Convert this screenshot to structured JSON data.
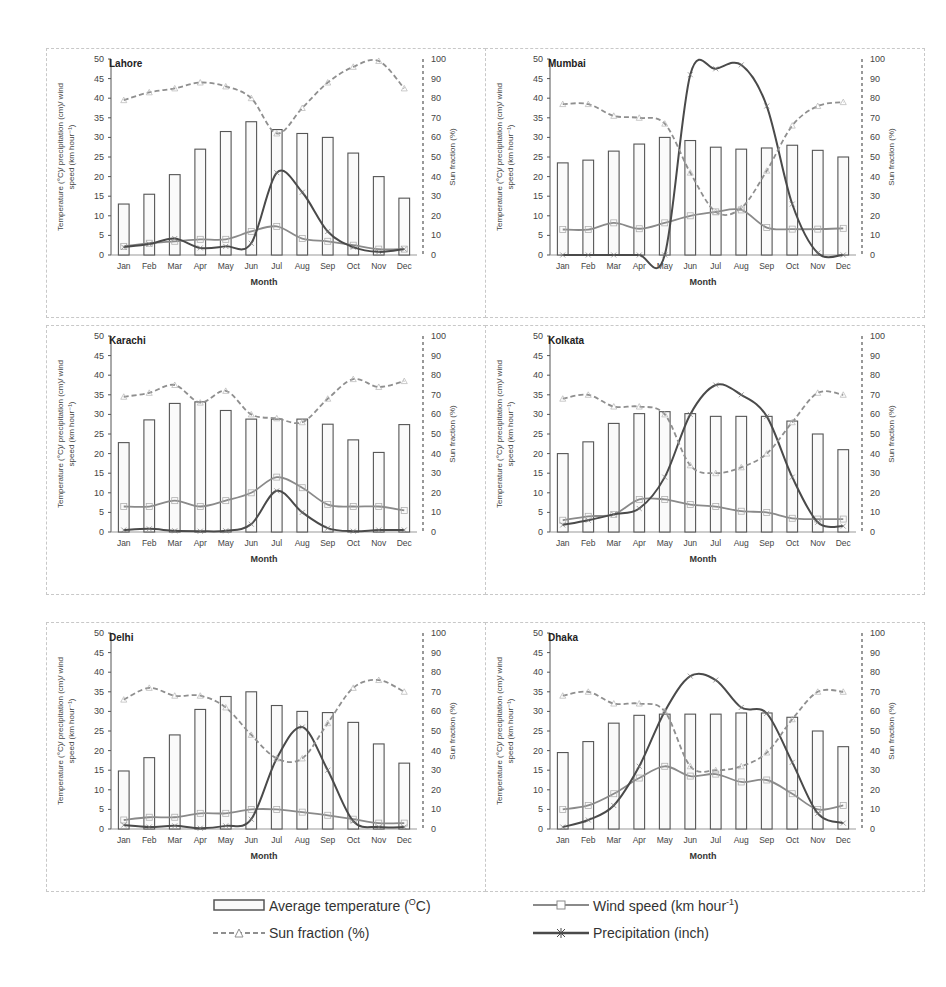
{
  "chart_data": [
    {
      "type": "bar+line",
      "title": "Lahore",
      "categories": [
        "Jan",
        "Feb",
        "Mar",
        "Apr",
        "May",
        "Jun",
        "Jul",
        "Aug",
        "Sep",
        "Oct",
        "Nov",
        "Dec"
      ],
      "xlabel": "Month",
      "ylabel": "Temperature (°C)/ precipitation (cm)/ wind speed (km hour⁻¹)",
      "y2label": "Sun fraction (%)",
      "ylim": [
        0,
        50
      ],
      "y2lim": [
        0,
        100
      ],
      "series": [
        {
          "name": "Average temperature (°C)",
          "type": "bar",
          "axis": "left",
          "values": [
            13,
            15.5,
            20.5,
            27,
            31.5,
            34,
            32,
            31,
            30,
            26,
            20,
            14.5
          ]
        },
        {
          "name": "Wind speed (km hour-1)",
          "type": "line",
          "axis": "left",
          "values": [
            2.2,
            3,
            3.5,
            4,
            4,
            6,
            7.3,
            4.2,
            3.5,
            2.5,
            1.5,
            1.5
          ]
        },
        {
          "name": "Precipitation (inch)",
          "type": "line",
          "axis": "left",
          "values": [
            2,
            2.8,
            4.2,
            1.8,
            2.2,
            3,
            21,
            16,
            6,
            2,
            0.8,
            1.5
          ]
        },
        {
          "name": "Sun fraction (%)",
          "type": "line",
          "axis": "right",
          "values": [
            79,
            83,
            85,
            88,
            86,
            80,
            62,
            75,
            88,
            96,
            99,
            85
          ]
        }
      ]
    },
    {
      "type": "bar+line",
      "title": "Mumbai",
      "categories": [
        "Jan",
        "Feb",
        "Mar",
        "Apr",
        "May",
        "Jun",
        "Jul",
        "Aug",
        "Sep",
        "Oct",
        "Nov",
        "Dec"
      ],
      "xlabel": "Month",
      "ylabel": "Temperature (°C)/ precipitation (cm)/ wind speed (km hour⁻¹)",
      "y2label": "Sun fraction (%)",
      "ylim": [
        0,
        50
      ],
      "y2lim": [
        0,
        100
      ],
      "series": [
        {
          "name": "Average temperature (°C)",
          "type": "bar",
          "axis": "left",
          "values": [
            23.5,
            24.2,
            26.5,
            28.3,
            30,
            29.2,
            27.5,
            27,
            27.3,
            28,
            26.7,
            25
          ]
        },
        {
          "name": "Wind speed (km hour-1)",
          "type": "line",
          "axis": "left",
          "values": [
            6.5,
            6.5,
            8.2,
            6.7,
            8.2,
            10,
            11,
            11.5,
            7,
            6.6,
            6.6,
            6.8
          ]
        },
        {
          "name": "Precipitation (inch)",
          "type": "line",
          "axis": "left",
          "values": [
            0,
            0,
            0,
            0,
            0,
            46,
            47.5,
            48.5,
            38,
            13,
            0.5,
            0
          ]
        },
        {
          "name": "Sun fraction (%)",
          "type": "line",
          "axis": "right",
          "values": [
            77,
            77,
            71,
            70,
            67,
            42,
            22,
            24,
            43,
            66,
            76,
            78
          ]
        }
      ]
    },
    {
      "type": "bar+line",
      "title": "Karachi",
      "categories": [
        "Jan",
        "Feb",
        "Mar",
        "Apr",
        "May",
        "Jun",
        "Jul",
        "Aug",
        "Sep",
        "Oct",
        "Nov",
        "Dec"
      ],
      "xlabel": "Month",
      "ylabel": "Temperature (°C)/ precipitation (cm)/ wind speed (km hour⁻¹)",
      "y2label": "Sun fraction (%)",
      "ylim": [
        0,
        50
      ],
      "y2lim": [
        0,
        100
      ],
      "series": [
        {
          "name": "Average temperature (°C)",
          "type": "bar",
          "axis": "left",
          "values": [
            22.8,
            28.6,
            32.8,
            33.2,
            31,
            28.8,
            28.8,
            28.8,
            27.5,
            23.5,
            20.3,
            27.4
          ]
        },
        {
          "name": "Wind speed (km hour-1)",
          "type": "line",
          "axis": "left",
          "values": [
            6.5,
            6.5,
            8,
            6.5,
            8,
            10,
            14,
            11.3,
            7,
            6.5,
            6.5,
            5.5
          ]
        },
        {
          "name": "Precipitation (inch)",
          "type": "line",
          "axis": "left",
          "values": [
            0.5,
            0.8,
            0.3,
            0.2,
            0.3,
            2,
            10.5,
            5,
            1,
            0.2,
            0.5,
            0.5
          ]
        },
        {
          "name": "Sun fraction (%)",
          "type": "line",
          "axis": "right",
          "values": [
            69,
            71,
            75,
            66,
            72,
            60,
            58,
            56,
            68,
            78,
            74,
            77
          ]
        }
      ]
    },
    {
      "type": "bar+line",
      "title": "Kolkata",
      "categories": [
        "Jan",
        "Feb",
        "Mar",
        "Apr",
        "May",
        "Jun",
        "Jul",
        "Aug",
        "Sep",
        "Oct",
        "Nov",
        "Dec"
      ],
      "xlabel": "Month",
      "ylabel": "Temperature (°C)/ precipitation (cm)/ wind speed (km hour⁻¹)",
      "y2label": "Sun fraction (%)",
      "ylim": [
        0,
        50
      ],
      "y2lim": [
        0,
        100
      ],
      "series": [
        {
          "name": "Average temperature (°C)",
          "type": "bar",
          "axis": "left",
          "values": [
            20,
            23,
            27.7,
            30.2,
            30.7,
            30.2,
            29.5,
            29.5,
            29.5,
            28.3,
            25,
            21
          ]
        },
        {
          "name": "Wind speed (km hour-1)",
          "type": "line",
          "axis": "left",
          "values": [
            3,
            4,
            4.5,
            8.3,
            8.3,
            7,
            6.5,
            5.3,
            5,
            3.5,
            3.3,
            3.3
          ]
        },
        {
          "name": "Precipitation (inch)",
          "type": "line",
          "axis": "left",
          "values": [
            1.8,
            3,
            4.5,
            6,
            14,
            30,
            37.5,
            35,
            29.5,
            14,
            2.5,
            1.5
          ]
        },
        {
          "name": "Sun fraction (%)",
          "type": "line",
          "axis": "right",
          "values": [
            68,
            70,
            64,
            64,
            60,
            34,
            30,
            33,
            40,
            56,
            71,
            70
          ]
        }
      ]
    },
    {
      "type": "bar+line",
      "title": "Delhi",
      "categories": [
        "Jan",
        "Feb",
        "Mar",
        "Apr",
        "May",
        "Jun",
        "Jul",
        "Aug",
        "Sep",
        "Oct",
        "Nov",
        "Dec"
      ],
      "xlabel": "Month",
      "ylabel": "Temperature (°C)/ precipitation (cm)/ wind speed (km hour⁻¹)",
      "y2label": "Sun fraction (%)",
      "ylim": [
        0,
        50
      ],
      "y2lim": [
        0,
        100
      ],
      "series": [
        {
          "name": "Average temperature (°C)",
          "type": "bar",
          "axis": "left",
          "values": [
            14.8,
            18.2,
            24,
            30.5,
            33.8,
            35,
            31.5,
            30,
            29.7,
            27.2,
            21.7,
            16.8
          ]
        },
        {
          "name": "Wind speed (km hour-1)",
          "type": "line",
          "axis": "left",
          "values": [
            2.3,
            3,
            3,
            4,
            4,
            5,
            5,
            4.3,
            3.5,
            2.5,
            1.5,
            1.5
          ]
        },
        {
          "name": "Precipitation (inch)",
          "type": "line",
          "axis": "left",
          "values": [
            1,
            0.5,
            0.8,
            0.2,
            0.8,
            2.5,
            18,
            26,
            15,
            2,
            0.5,
            0.5
          ]
        },
        {
          "name": "Sun fraction (%)",
          "type": "line",
          "axis": "right",
          "values": [
            66,
            72,
            68,
            68,
            62,
            48,
            36,
            36,
            54,
            72,
            76,
            70
          ]
        }
      ]
    },
    {
      "type": "bar+line",
      "title": "Dhaka",
      "categories": [
        "Jan",
        "Feb",
        "Mar",
        "Apr",
        "May",
        "Jun",
        "Jul",
        "Aug",
        "Sep",
        "Oct",
        "Nov",
        "Dec"
      ],
      "xlabel": "Month",
      "ylabel": "Temperature (°C)/ precipitation (cm)/ wind speed (km hour⁻¹)",
      "y2label": "Sun fraction (%)",
      "ylim": [
        0,
        50
      ],
      "y2lim": [
        0,
        100
      ],
      "series": [
        {
          "name": "Average temperature (°C)",
          "type": "bar",
          "axis": "left",
          "values": [
            19.5,
            22.3,
            27,
            29,
            29.3,
            29.3,
            29.3,
            29.6,
            29.6,
            28.5,
            25,
            21
          ]
        },
        {
          "name": "Wind speed (km hour-1)",
          "type": "line",
          "axis": "left",
          "values": [
            5,
            6,
            9,
            13,
            16,
            13.5,
            14,
            12,
            12.5,
            9,
            5,
            6
          ]
        },
        {
          "name": "Precipitation (inch)",
          "type": "line",
          "axis": "left",
          "values": [
            0.5,
            2.3,
            6,
            16,
            30,
            39,
            38,
            31,
            29.5,
            17,
            4,
            1.5
          ]
        },
        {
          "name": "Sun fraction (%)",
          "type": "line",
          "axis": "right",
          "values": [
            68,
            70,
            64,
            64,
            60,
            32,
            30,
            32,
            39,
            56,
            70,
            70
          ]
        }
      ]
    }
  ],
  "axis_text": {
    "xlabel": "Month",
    "ylabel_line1": "Temperature (°C)/ precipitation (cm)/ wind",
    "ylabel_line2": "speed (km hour⁻¹)",
    "y2label": "Sun fraction (%)",
    "left_ticks": [
      "0",
      "5",
      "10",
      "15",
      "20",
      "25",
      "30",
      "35",
      "40",
      "45",
      "50"
    ],
    "right_ticks": [
      "0",
      "10",
      "20",
      "30",
      "40",
      "50",
      "60",
      "70",
      "80",
      "90",
      "100"
    ],
    "months": [
      "Jan",
      "Feb",
      "Mar",
      "Apr",
      "May",
      "Jun",
      "Jul",
      "Aug",
      "Sep",
      "Oct",
      "Nov",
      "Dec"
    ]
  },
  "legend": {
    "temperature": "Average temperature (",
    "temperature_unit_sup": "O",
    "temperature_unit_end": "C)",
    "wind": "Wind speed (km hour",
    "wind_sup": "-1",
    "wind_end": ")",
    "sun": "Sun fraction (%)",
    "precip": "Precipitation (inch)"
  },
  "colors": {
    "bar_stroke": "#555555",
    "bar_fill": "#fafafa",
    "wind": "#8a8a8a",
    "precip": "#4a4a4a",
    "sun": "#8f8f8f",
    "axis": "#555555",
    "frame": "#c8c8c8"
  }
}
